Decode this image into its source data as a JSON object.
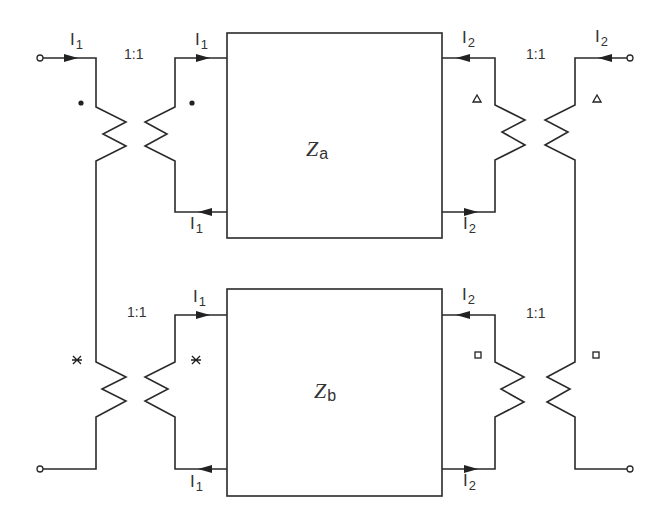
{
  "diagram": {
    "type": "circuit-schematic",
    "blocks": [
      {
        "id": "za",
        "symbol": "Z",
        "subscript": "a"
      },
      {
        "id": "zb",
        "symbol": "Z",
        "subscript": "b"
      }
    ],
    "transformers": [
      {
        "id": "t-left-top",
        "ratio": "1:1",
        "polarity_mark": "dot"
      },
      {
        "id": "t-right-top",
        "ratio": "1:1",
        "polarity_mark": "triangle"
      },
      {
        "id": "t-left-bottom",
        "ratio": "1:1",
        "polarity_mark": "cross"
      },
      {
        "id": "t-right-bottom",
        "ratio": "1:1",
        "polarity_mark": "square"
      }
    ],
    "currents": {
      "i1": {
        "symbol": "I",
        "subscript": "1"
      },
      "i2": {
        "symbol": "I",
        "subscript": "2"
      }
    }
  }
}
